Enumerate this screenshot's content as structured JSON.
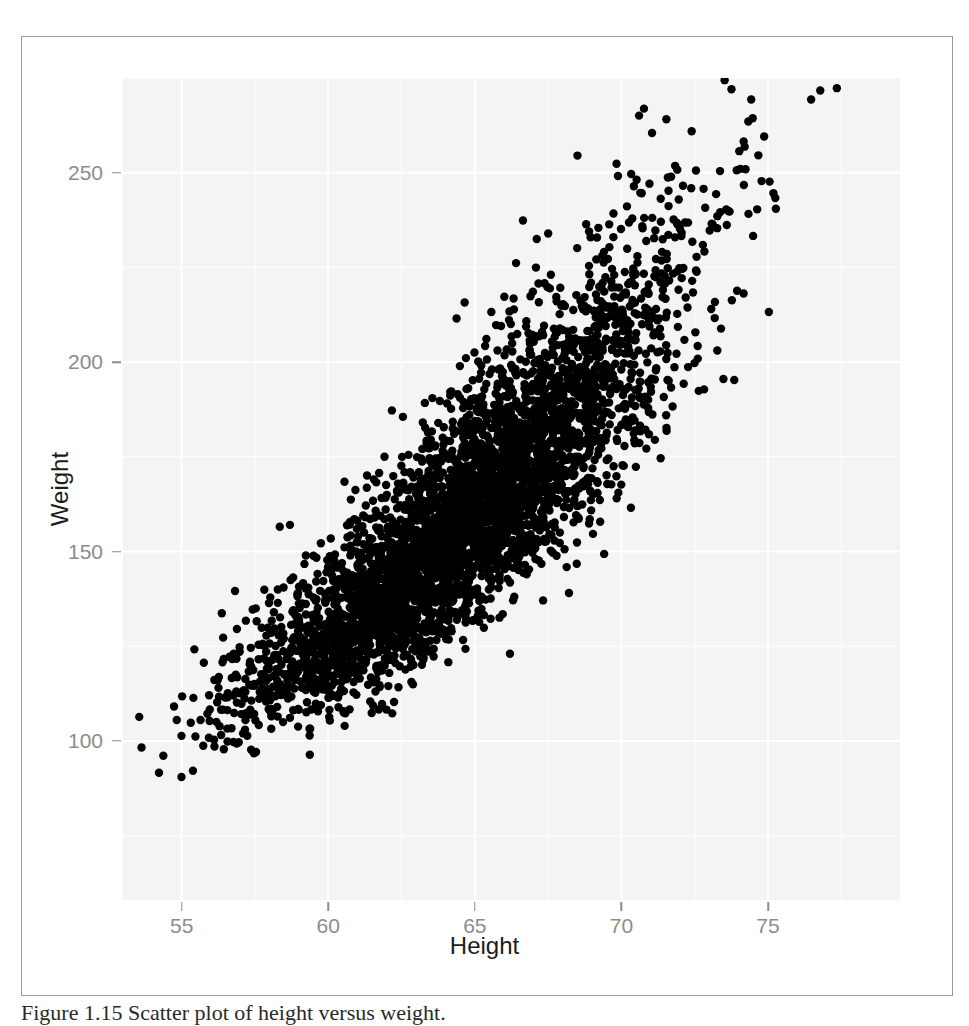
{
  "figure": {
    "caption": "Figure 1.15  Scatter plot of height versus weight.",
    "background_color": "#ffffff",
    "frame_border_color": "#9b9b9b"
  },
  "chart_data": {
    "type": "scatter",
    "title": "",
    "subtitle": "",
    "xlabel": "Height",
    "ylabel": "Weight",
    "xlim": [
      53.0,
      79.5
    ],
    "ylim": [
      58,
      275
    ],
    "xticks": [
      55,
      60,
      65,
      70,
      75
    ],
    "yticks": [
      100,
      150,
      200,
      250
    ],
    "xtick_labels": [
      "55",
      "60",
      "65",
      "70",
      "75"
    ],
    "ytick_labels": [
      "100",
      "150",
      "200",
      "250"
    ],
    "grid": true,
    "grid_color": "#ffffff",
    "panel_background": "#f4f4f4",
    "axis_text_color": "#8c8c8c",
    "axis_title_color": "#1c1c1c",
    "legend": null,
    "legend_position": "none",
    "annotations": [],
    "n_points": 4200,
    "point_color": "#000000",
    "point_radius_px": 4.2,
    "point_shape": "circle",
    "distribution": {
      "model": "bivariate-normal",
      "x_mean": 64.6,
      "x_sd": 3.55,
      "y_mean": 160.0,
      "y_sd": 29.5,
      "correlation": 0.87,
      "seed": 20240115
    }
  }
}
